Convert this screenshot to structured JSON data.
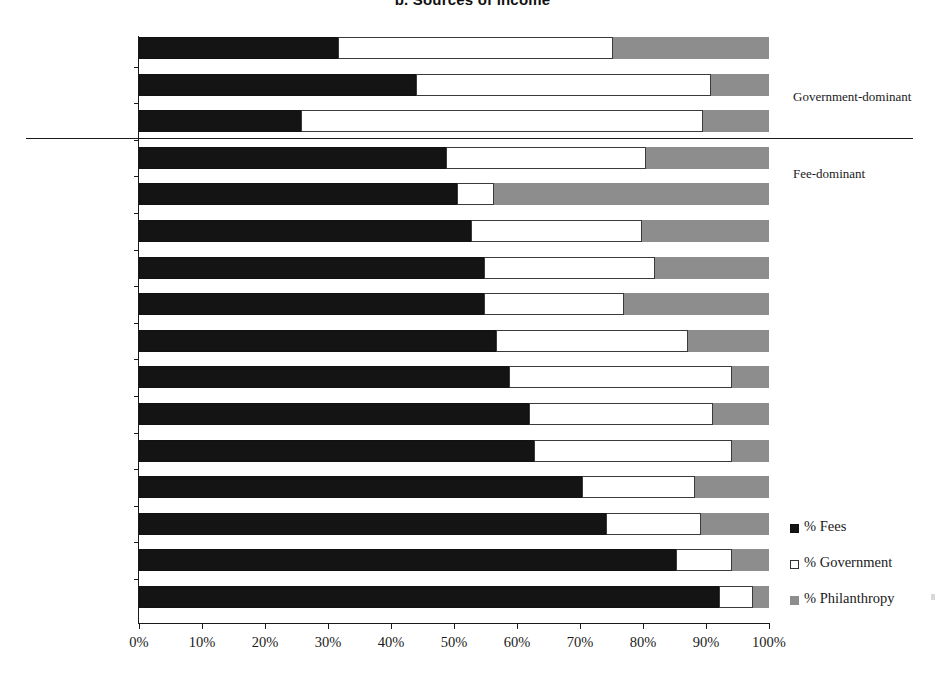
{
  "chart": {
    "title": "b. Sources of income",
    "xlabel": "",
    "ylabel": ""
  },
  "annotations": {
    "government_dominant": "Government-dominant",
    "fee_dominant": "Fee-dominant"
  },
  "legend": [
    {
      "label": "% Fees",
      "color": "#141414",
      "swatch": "fees-swatch"
    },
    {
      "label": "% Government",
      "color": "#ffffff",
      "swatch": "government-swatch"
    },
    {
      "label": "% Philanthropy",
      "color": "#8d8d8d",
      "swatch": "philanthropy-swatch"
    }
  ],
  "axis": {
    "ticks": [
      "0%",
      "10%",
      "20%",
      "30%",
      "40%",
      "50%",
      "60%",
      "70%",
      "80%",
      "90%",
      "100%"
    ],
    "min": 0,
    "max": 100
  },
  "chart_data": {
    "type": "bar",
    "orientation": "horizontal",
    "stacked": true,
    "title": "b. Sources of income",
    "xlabel": "",
    "ylabel": "",
    "xlim": [
      0,
      100
    ],
    "xticks": [
      0,
      10,
      20,
      30,
      40,
      50,
      60,
      70,
      80,
      90,
      100
    ],
    "xtick_labels": [
      "0%",
      "10%",
      "20%",
      "30%",
      "40%",
      "50%",
      "60%",
      "70%",
      "80%",
      "90%",
      "100%"
    ],
    "grid": false,
    "legend_position": "right-bottom",
    "categories": [
      "South Africa",
      "United Kingdom",
      "Israel",
      "Spain",
      "Pakistan",
      "Tanzania",
      "Hungary",
      "Slovakia",
      "United States",
      "Finland",
      "Sweden",
      "Australia",
      "Peru",
      "Brazil",
      "Mexico",
      "Philippines"
    ],
    "series": [
      {
        "name": "% Fees",
        "color": "#141414",
        "values": [
          31.6,
          44.0,
          25.7,
          48.7,
          50.5,
          52.7,
          54.8,
          54.8,
          56.7,
          58.7,
          61.9,
          62.7,
          70.3,
          74.1,
          85.2,
          92.0
        ]
      },
      {
        "name": "% Government",
        "color": "#ffffff",
        "values": [
          43.6,
          46.8,
          63.8,
          31.8,
          5.8,
          27.1,
          27.1,
          22.2,
          30.4,
          35.4,
          29.2,
          31.4,
          18.0,
          15.1,
          8.9,
          5.5
        ]
      },
      {
        "name": "% Philanthropy",
        "color": "#8d8d8d",
        "values": [
          24.8,
          9.2,
          10.5,
          19.5,
          43.7,
          20.2,
          18.1,
          23.0,
          12.9,
          5.9,
          8.9,
          5.9,
          11.7,
          10.8,
          5.9,
          2.5
        ]
      }
    ],
    "group_divider": {
      "after_category": "Israel",
      "above_label": "Government-dominant",
      "below_label": "Fee-dominant"
    }
  }
}
